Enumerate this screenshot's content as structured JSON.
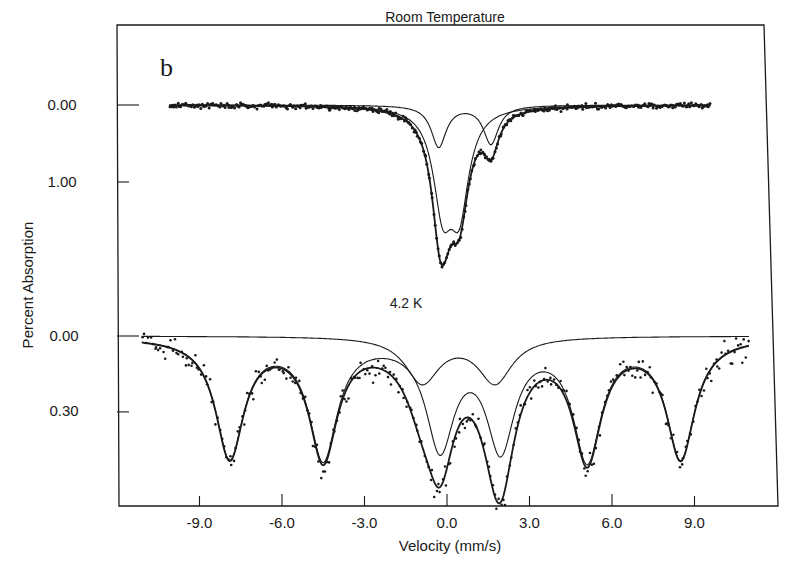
{
  "figure": {
    "panel_letter": "b",
    "background": "#ffffff",
    "ink_color": "#1a1a1a"
  },
  "chart_data": {
    "type": "line",
    "xlabel": "Velocity (mm/s)",
    "ylabel": "Percent Absorption",
    "xlim": [
      -11.5,
      12.0
    ],
    "x_ticks": [
      -9.0,
      -6.0,
      -3.0,
      0.0,
      3.0,
      6.0,
      9.0
    ],
    "x_tick_labels": [
      "-9.0",
      "-6.0",
      "-3.0",
      "0.0",
      "3.0",
      "6.0",
      "9.0"
    ],
    "grid": false,
    "legend": null,
    "panels": [
      {
        "name": "room-temperature",
        "label": "Room Temperature",
        "y_ticks": [
          0.0,
          1.0
        ],
        "y_tick_labels": [
          "0.00",
          "1.00"
        ],
        "y_inverted": true,
        "x_range": [
          -10.1,
          9.6
        ],
        "components": [
          {
            "name": "Doublet 1 (larger)",
            "lines": [
              {
                "center": -0.15,
                "depth": 1.22,
                "hwhm": 0.42
              },
              {
                "center": 0.45,
                "depth": 1.22,
                "hwhm": 0.42
              }
            ]
          },
          {
            "name": "Doublet 2 (smaller)",
            "lines": [
              {
                "center": -0.3,
                "depth": 0.54,
                "hwhm": 0.33
              },
              {
                "center": 1.6,
                "depth": 0.5,
                "hwhm": 0.33
              }
            ]
          }
        ],
        "total_fit_min": {
          "velocity": -0.1,
          "absorption": 1.78
        },
        "shoulder": {
          "velocity": 1.55,
          "absorption": 0.66
        },
        "noise": 0.025,
        "n_points": 400
      },
      {
        "name": "4.2K",
        "label": "4.2 K",
        "y_ticks": [
          0.0,
          0.3
        ],
        "y_tick_labels": [
          "0.00",
          "0.30"
        ],
        "y_inverted": true,
        "x_range": [
          -11.1,
          11.0
        ],
        "components": [
          {
            "name": "Sextet (magnetic)",
            "lines": [
              {
                "center": -7.9,
                "depth": 0.47,
                "hwhm": 0.62
              },
              {
                "center": -4.5,
                "depth": 0.47,
                "hwhm": 0.62
              },
              {
                "center": -0.25,
                "depth": 0.42,
                "hwhm": 0.62
              },
              {
                "center": 1.95,
                "depth": 0.42,
                "hwhm": 0.62
              },
              {
                "center": 5.1,
                "depth": 0.47,
                "hwhm": 0.62
              },
              {
                "center": 8.5,
                "depth": 0.47,
                "hwhm": 0.62
              }
            ]
          },
          {
            "name": "Doublet (paramagnetic)",
            "lines": [
              {
                "center": -0.9,
                "depth": 0.18,
                "hwhm": 0.75
              },
              {
                "center": 1.75,
                "depth": 0.18,
                "hwhm": 0.75
              }
            ]
          }
        ],
        "fit_minima": [
          {
            "velocity": -7.9,
            "absorption": 0.5
          },
          {
            "velocity": -4.5,
            "absorption": 0.5
          },
          {
            "velocity": -0.2,
            "absorption": 0.52
          },
          {
            "velocity": 2.0,
            "absorption": 0.59
          },
          {
            "velocity": 5.1,
            "absorption": 0.51
          },
          {
            "velocity": 8.5,
            "absorption": 0.5
          }
        ],
        "noise": 0.035,
        "n_points": 300
      }
    ]
  },
  "layout": {
    "frame": {
      "left": 117,
      "top": 25,
      "right": 778,
      "bottom": 506
    },
    "x_zero_px": 447,
    "px_per_mms": 27.5,
    "panels": [
      {
        "baseline_px": 105,
        "px_per_unit": 77
      },
      {
        "baseline_px": 336,
        "px_per_unit": 253
      }
    ]
  }
}
